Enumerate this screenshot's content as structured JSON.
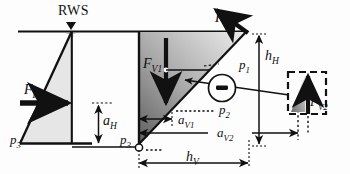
{
  "figure": {
    "background": "#fdfdfd",
    "ink": "#111111",
    "fill_light": "#e3e3e3",
    "fill_dark": "#6d6d6d"
  },
  "labels": {
    "rws": "RWS",
    "f_h": "F",
    "f_h_sub": "H",
    "f_p": "F",
    "f_p_sub": "P",
    "f_v1": "F",
    "f_v1_sub": "V1",
    "f_v2": "F",
    "f_v2_sub": "V2",
    "a_h": "a",
    "a_h_sub": "H",
    "a_v1": "a",
    "a_v1_sub": "V1",
    "a_v2": "a",
    "a_v2_sub": "V2",
    "h_h": "h",
    "h_h_sub": "H",
    "h_v": "h",
    "h_v_sub": "V",
    "p1": "p",
    "p1_sub": "1",
    "p2": "p",
    "p2_sub": "2",
    "p3_left": "p",
    "p3_left_sub": "3",
    "p3_mid": "p",
    "p3_mid_sub": "3",
    "minus_sign": "–"
  },
  "annotations": {
    "water_surface_marker": "triangle-down",
    "hinge_marker": "open-circle",
    "negative_pressure_badge": "circled-minus",
    "inset_outline": "dashed-rectangle"
  },
  "elements": [
    {
      "name": "ground-line",
      "kind": "line"
    },
    {
      "name": "left-pressure-triangle",
      "kind": "polygon"
    },
    {
      "name": "left-wall",
      "kind": "line"
    },
    {
      "name": "center-wedge",
      "kind": "polygon"
    },
    {
      "name": "center-wall",
      "kind": "line"
    },
    {
      "name": "force-arrow-fh",
      "kind": "arrow"
    },
    {
      "name": "force-arrow-fp",
      "kind": "arrow"
    },
    {
      "name": "force-arrow-fv1",
      "kind": "arrow"
    },
    {
      "name": "force-arrow-fv2",
      "kind": "arrow"
    },
    {
      "name": "dimension-ah",
      "kind": "dimension"
    },
    {
      "name": "dimension-av1",
      "kind": "dimension"
    },
    {
      "name": "dimension-av2",
      "kind": "dimension"
    },
    {
      "name": "dimension-hh",
      "kind": "dimension"
    },
    {
      "name": "dimension-hv",
      "kind": "dimension"
    },
    {
      "name": "leader-p1",
      "kind": "leader"
    },
    {
      "name": "leader-p2",
      "kind": "leader"
    },
    {
      "name": "inset-fv2",
      "kind": "group"
    }
  ]
}
